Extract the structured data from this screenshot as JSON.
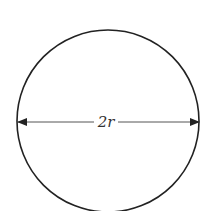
{
  "diagram": {
    "shape": "circle",
    "center": [
      108,
      121
    ],
    "radius": 91,
    "stroke_color": "#222222",
    "diameter_line": {
      "y": 122,
      "x1": 18,
      "x2": 199,
      "arrows": "both",
      "color": "#444444"
    },
    "label": "2r"
  }
}
